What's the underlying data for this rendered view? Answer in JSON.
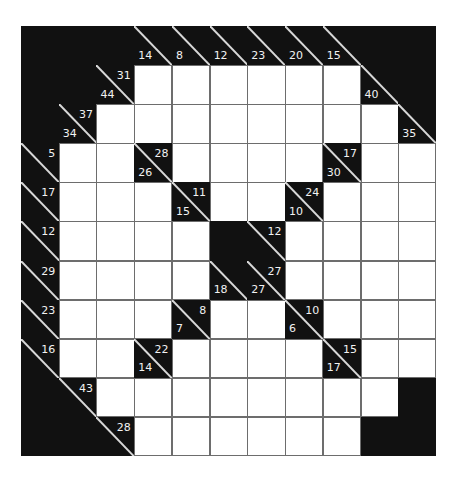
{
  "puzzle": {
    "type": "kakuro",
    "rows": 11,
    "cols": 11,
    "colors": {
      "block": "#111111",
      "cell": "#ffffff",
      "grid_line": "#6d6d6d",
      "clue_text": "#f2f2f2"
    },
    "grid": [
      [
        "B",
        "B",
        "B",
        {
          "d": 14
        },
        {
          "d": 8
        },
        {
          "d": 12
        },
        {
          "d": 23
        },
        {
          "d": 20
        },
        {
          "d": 15
        },
        "B",
        "B"
      ],
      [
        "B",
        "B",
        {
          "d": 44,
          "r": 31
        },
        "W",
        "W",
        "W",
        "W",
        "W",
        "W",
        {
          "d": 40
        },
        "B"
      ],
      [
        "B",
        {
          "d": 34,
          "r": 37
        },
        "W",
        "W",
        "W",
        "W",
        "W",
        "W",
        "W",
        "W",
        {
          "d": 35
        }
      ],
      [
        {
          "r": 5
        },
        "W",
        "W",
        {
          "d": 26,
          "r": 28
        },
        "W",
        "W",
        "W",
        "W",
        {
          "d": 30,
          "r": 17
        },
        "W",
        "W"
      ],
      [
        {
          "r": 17
        },
        "W",
        "W",
        "W",
        {
          "d": 15,
          "r": 11
        },
        "W",
        "W",
        {
          "d": 10,
          "r": 24
        },
        "W",
        "W",
        "W"
      ],
      [
        {
          "r": 12
        },
        "W",
        "W",
        "W",
        "W",
        "B",
        {
          "r": 12
        },
        "W",
        "W",
        "W",
        "W"
      ],
      [
        {
          "r": 29
        },
        "W",
        "W",
        "W",
        "W",
        {
          "d": 18
        },
        {
          "d": 27,
          "r": 27
        },
        "W",
        "W",
        "W",
        "W"
      ],
      [
        {
          "r": 23
        },
        "W",
        "W",
        "W",
        {
          "d": 7,
          "r": 8
        },
        "W",
        "W",
        {
          "d": 6,
          "r": 10
        },
        "W",
        "W",
        "W"
      ],
      [
        {
          "r": 16
        },
        "W",
        "W",
        {
          "d": 14,
          "r": 22
        },
        "W",
        "W",
        "W",
        "W",
        {
          "d": 17,
          "r": 15
        },
        "W",
        "W"
      ],
      [
        "B",
        {
          "r": 43
        },
        "W",
        "W",
        "W",
        "W",
        "W",
        "W",
        "W",
        "W",
        "B"
      ],
      [
        "B",
        "B",
        {
          "r": 28
        },
        "W",
        "W",
        "W",
        "W",
        "W",
        "W",
        "B",
        "B"
      ]
    ]
  }
}
